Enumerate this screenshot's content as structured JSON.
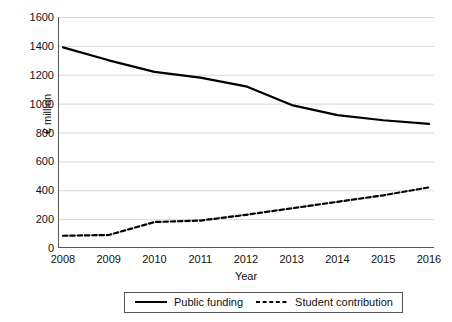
{
  "chart_data": {
    "type": "line",
    "title": "",
    "xlabel": "Year",
    "ylabel": "€ million",
    "categories": [
      "2008",
      "2009",
      "2010",
      "2011",
      "2012",
      "2013",
      "2014",
      "2015",
      "2016"
    ],
    "x": [
      2008,
      2009,
      2010,
      2011,
      2012,
      2013,
      2014,
      2015,
      2016
    ],
    "xlim": [
      2008,
      2016
    ],
    "ylim": [
      0,
      1600
    ],
    "ytick_labels": [
      "0",
      "200",
      "400",
      "600",
      "800",
      "1000",
      "1200",
      "1400",
      "1600"
    ],
    "yticks": [
      0,
      200,
      400,
      600,
      800,
      1000,
      1200,
      1400,
      1600
    ],
    "grid": "horizontal",
    "legend_position": "bottom-center",
    "series": [
      {
        "name": "Public funding",
        "style": "solid",
        "color": "#000000",
        "values": [
          1390,
          1300,
          1220,
          1180,
          1120,
          990,
          920,
          885,
          860
        ]
      },
      {
        "name": "Student contribution",
        "style": "dashed",
        "color": "#000000",
        "values": [
          85,
          90,
          180,
          190,
          230,
          275,
          320,
          365,
          420
        ]
      }
    ]
  },
  "legend": {
    "items": [
      {
        "label": "Public funding",
        "icon": "solid-line-icon"
      },
      {
        "label": "Student contribution",
        "icon": "dashed-line-icon"
      }
    ]
  },
  "colors": {
    "axis": "#555555",
    "grid": "#d9d9d9",
    "series": "#000000",
    "background": "#ffffff"
  }
}
